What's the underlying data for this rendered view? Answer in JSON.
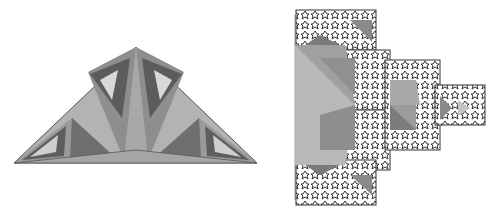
{
  "figures": [
    {
      "id": "left",
      "description": "Sierpinski-like fractal triangle with recursive inner triangles in gray shades",
      "colors": {
        "light": "#b3b3b3",
        "mid": "#9a9a9a",
        "dark": "#6f6f6f",
        "edge": "#444444"
      }
    },
    {
      "id": "right",
      "description": "Koch-snowflake-like fractal tree of squares and triangles branching right",
      "colors": {
        "light": "#bdbdbd",
        "mid": "#9c9c9c",
        "dark": "#7a7a7a",
        "edge": "#333333"
      }
    }
  ]
}
